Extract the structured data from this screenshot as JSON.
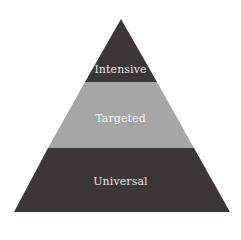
{
  "diagram": {
    "type": "pyramid",
    "tiers": [
      {
        "label": "Intensive",
        "level": "top",
        "color": "#3b3739"
      },
      {
        "label": "Targeted",
        "level": "middle",
        "color": "#a6a6a6"
      },
      {
        "label": "Universal",
        "level": "bottom",
        "color": "#3b3739"
      }
    ],
    "text_color": "#e8e8e8"
  }
}
